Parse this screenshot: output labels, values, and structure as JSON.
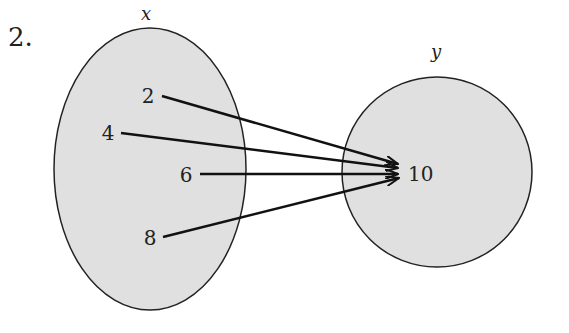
{
  "problem_number": "2.",
  "domain_set": {
    "label": "x",
    "elements": [
      "2",
      "4",
      "6",
      "8"
    ]
  },
  "range_set": {
    "label": "y",
    "elements": [
      "10"
    ]
  },
  "mappings": [
    {
      "from": "2",
      "to": "10"
    },
    {
      "from": "4",
      "to": "10"
    },
    {
      "from": "6",
      "to": "10"
    },
    {
      "from": "8",
      "to": "10"
    }
  ],
  "colors": {
    "fill": "#e0e0e0",
    "stroke": "#222222",
    "arrow": "#111111"
  }
}
